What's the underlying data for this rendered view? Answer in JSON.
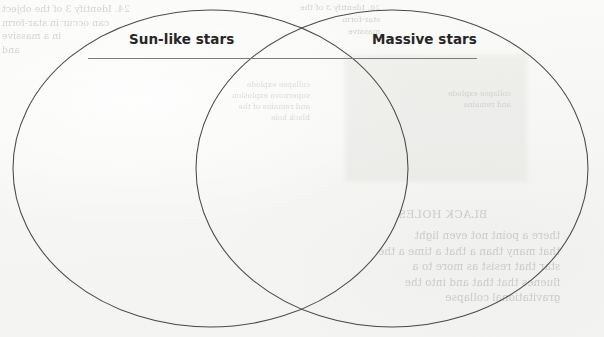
{
  "document": {
    "kind": "venn-diagram-worksheet",
    "medium": "scanned-paper"
  },
  "diagram": {
    "type": "venn",
    "set_count": 2,
    "left_label": "Sun-like stars",
    "right_label": "Massive stars",
    "stroke_color": "#4a4a4a",
    "background_color": "#f7f7f5",
    "label_color": "#262626",
    "rule_color": "#7d7d7d",
    "circles": [
      {
        "name": "sun-like-stars",
        "cx": 210.5,
        "cy": 168.5,
        "rx": 197.5,
        "ry": 158.5
      },
      {
        "name": "massive-stars",
        "cx": 392.0,
        "cy": 168.5,
        "rx": 196.0,
        "ry": 158.5
      }
    ],
    "rule": {
      "x1": 88,
      "x2": 477,
      "y": 58
    }
  },
  "bleedthrough": {
    "note": "Faint mirrored text showing through from the reverse side of the page; not foreground content.",
    "top_left": "24. Identify 3 of the object\ncan occur in star-form\nin a massive\nand",
    "top_center": "26. Identify 3 of the\nstar-form\nmassive",
    "middle_center": "collapse explode\nsupernova explosion\nand remains of the\nblack hole",
    "right_middle": "collapse explode\nand remains",
    "bottom_right_heading": "BLACK HOLES",
    "bottom_right": "there a point not even light\nthat many than a that a time a the\nstar that resist as more to a\nfluenes that that and into the\ngravitational collapse"
  },
  "colors": {
    "paper": "#f7f7f5",
    "ink": "#262626",
    "outline": "#4a4a4a",
    "rule": "#7d7d7d"
  }
}
